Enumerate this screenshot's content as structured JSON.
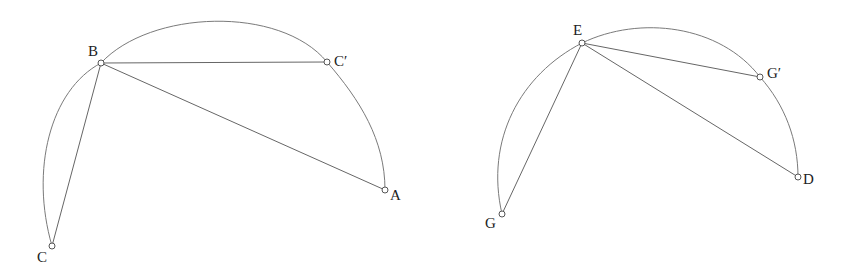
{
  "figures": [
    {
      "id": "left",
      "points": {
        "A": {
          "label": "A",
          "x": 385,
          "y": 190
        },
        "B": {
          "label": "B",
          "x": 101,
          "y": 63
        },
        "C": {
          "label": "C",
          "x": 52,
          "y": 246
        },
        "C_prime": {
          "label": "C′",
          "x": 327,
          "y": 62
        }
      },
      "segments": [
        [
          "B",
          "C"
        ],
        [
          "B",
          "C_prime"
        ],
        [
          "B",
          "A"
        ]
      ],
      "arc": "C-B-C′-A"
    },
    {
      "id": "right",
      "points": {
        "D": {
          "label": "D",
          "x": 798,
          "y": 177
        },
        "E": {
          "label": "E",
          "x": 582,
          "y": 43
        },
        "G": {
          "label": "G",
          "x": 502,
          "y": 214
        },
        "G_prime": {
          "label": "G′",
          "x": 760,
          "y": 77
        }
      },
      "segments": [
        [
          "E",
          "G"
        ],
        [
          "E",
          "G_prime"
        ],
        [
          "E",
          "D"
        ]
      ],
      "arc": "G-E-G′-D"
    }
  ],
  "colors": {
    "stroke": "#666666",
    "background": "#ffffff"
  }
}
